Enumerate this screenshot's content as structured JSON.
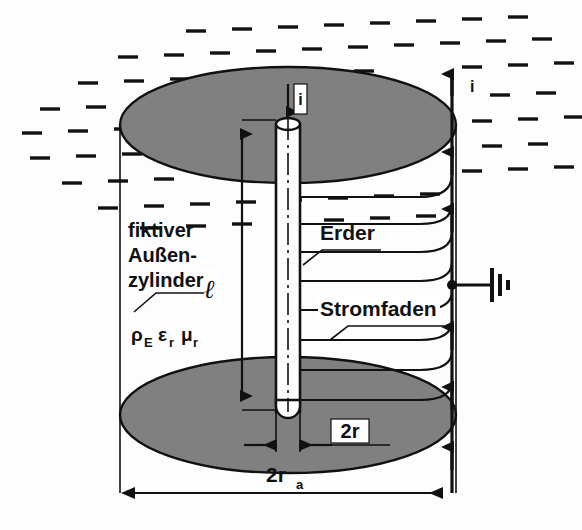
{
  "figure": {
    "language": "de",
    "background_color": "#fdfdfd",
    "soil_fill_color": "#808080",
    "line_color": "#111111",
    "rod_fill_color": "#fdfdfd"
  },
  "labels": {
    "fictitious_cylinder_line1": "fiktiver",
    "fictitious_cylinder_line2": "Außen-",
    "fictitious_cylinder_line3": "zylinder",
    "material_properties": "ρ",
    "material_properties_sub1": "E",
    "material_properties_eps": "ε",
    "material_properties_eps_sub": "r",
    "material_properties_mu": "μ",
    "material_properties_mu_sub": "r",
    "earth_electrode": "Erder",
    "current_filament": "Stromfaden",
    "length_symbol": "ℓ",
    "current_top": "i",
    "current_right": "i",
    "diameter_inner": "2r",
    "diameter_outer": "2r",
    "diameter_outer_sub": "a"
  },
  "icons": {
    "ground_symbol": "earth-ground-icon",
    "arrow_down": "arrow-down-icon",
    "arrow_up": "arrow-up-icon",
    "junction_dot": "junction-dot-icon"
  },
  "geometry": {
    "outer_cylinder_left_x": 120,
    "outer_cylinder_right_x": 455,
    "top_ellipse_cx": 288,
    "top_ellipse_cy": 125,
    "top_ellipse_rx": 168,
    "top_ellipse_ry": 58,
    "bottom_ellipse_cx": 288,
    "bottom_ellipse_cy": 415,
    "bottom_ellipse_rx": 168,
    "bottom_ellipse_ry": 58,
    "rod_left_x": 276,
    "rod_right_x": 300,
    "rod_top_y": 118,
    "rod_bottom_y": 418,
    "dimension_line_y": 493,
    "length_dim_x": 242,
    "length_dim_top_y": 120,
    "length_dim_bottom_y": 410
  },
  "annotations": {
    "current_filament_count": 7,
    "return_arrow_count": 6,
    "hatch_rows": 9,
    "description": "Grounding rod (Erder) of length l and diameter 2r inside a fictitious outer soil cylinder of diameter 2r_a with resistivity rho_E, permittivity eps_r and permeability mu_r. Current i enters at the top of the rod and flows radially outward along current filaments (Stromfaden) to the outer cylinder surface and returns."
  }
}
